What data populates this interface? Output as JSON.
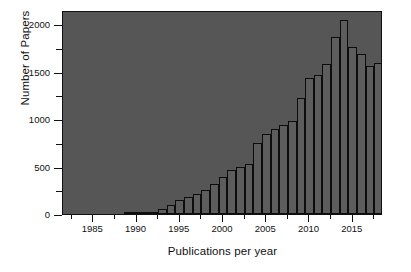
{
  "chart_data": {
    "type": "bar",
    "title": "",
    "xlabel": "Publications per year",
    "ylabel": "Number of Papers",
    "xlim": [
      1981.5,
      2018.5
    ],
    "ylim": [
      0,
      2150
    ],
    "grid": false,
    "legend": null,
    "y_ticks": [
      0,
      500,
      1000,
      1500,
      2000
    ],
    "y_tick_labels": [
      "0",
      "500",
      "1000",
      "1500",
      "2000"
    ],
    "y_minor_ticks": [
      250,
      750,
      1250,
      1750
    ],
    "x_ticks": [
      1985,
      1990,
      1995,
      2000,
      2005,
      2010,
      2015
    ],
    "x_tick_labels": [
      "1985",
      "1990",
      "1995",
      "2000",
      "2005",
      "2010",
      "2015"
    ],
    "x_minor_ticks": [
      1982.5,
      1987.5,
      1992.5,
      1997.5,
      2002.5,
      2007.5,
      2012.5,
      2017.5
    ],
    "categories": [
      1982,
      1983,
      1984,
      1985,
      1986,
      1987,
      1988,
      1989,
      1990,
      1991,
      1992,
      1993,
      1994,
      1995,
      1996,
      1997,
      1998,
      1999,
      2000,
      2001,
      2002,
      2003,
      2004,
      2005,
      2006,
      2007,
      2008,
      2009,
      2010,
      2011,
      2012,
      2013,
      2014,
      2015,
      2016,
      2017,
      2018
    ],
    "values": [
      0,
      0,
      0,
      0,
      0,
      0,
      0,
      2,
      6,
      12,
      26,
      55,
      100,
      150,
      175,
      210,
      255,
      320,
      390,
      465,
      495,
      530,
      750,
      840,
      900,
      935,
      980,
      1225,
      1430,
      1470,
      1580,
      1870,
      2040,
      1755,
      1685,
      1560,
      1590
    ],
    "values_tail": [
      1545,
      310
    ],
    "bar_color": "#5d5d5d",
    "bar_edge_color": "#0d0d0d",
    "plot_background": "#565656",
    "figure_background": "#ffffff",
    "axis_color": "#111111"
  },
  "axes": {
    "ylabel": "Number of Papers",
    "xlabel": "Publications per year"
  }
}
